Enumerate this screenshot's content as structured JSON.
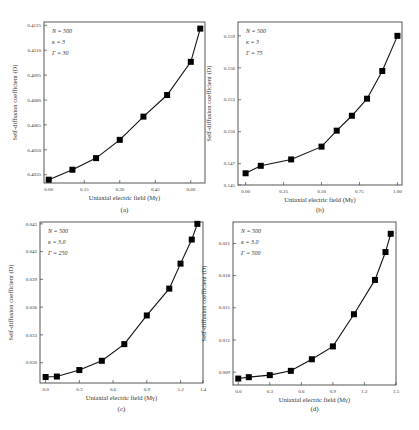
{
  "chart_data": [
    {
      "type": "line",
      "panel": "a",
      "caption": "(a)",
      "xlabel": "Uniaxial electric field (Mγ)",
      "ylabel": "Self-diffusion coefficient (D)",
      "annotations": [
        "N = 500",
        "κ = 3",
        "Γ = 30"
      ],
      "xlim": [
        -0.02,
        0.66
      ],
      "ylim": [
        0.403,
        0.4127
      ],
      "xticks": [
        0.0,
        0.15,
        0.3,
        0.45,
        0.6
      ],
      "xtick_labels": [
        "0.00",
        "0.15",
        "0.30",
        "0.45",
        "0.60"
      ],
      "yticks": [
        0.4035,
        0.405,
        0.4065,
        0.408,
        0.4095,
        0.411,
        0.4125
      ],
      "ytick_labels": [
        "0.4035",
        "0.4050",
        "0.4065",
        "0.4080",
        "0.4095",
        "0.4110",
        "0.4125"
      ],
      "grid": false,
      "marker": "square",
      "series": [
        {
          "name": "D",
          "x": [
            0.0,
            0.1,
            0.2,
            0.3,
            0.4,
            0.5,
            0.6,
            0.64
          ],
          "y": [
            0.4032,
            0.4038,
            0.4045,
            0.4056,
            0.407,
            0.4083,
            0.4103,
            0.4123
          ]
        }
      ]
    },
    {
      "type": "line",
      "panel": "b",
      "caption": "(b)",
      "xlabel": "Uniaxial electric field (Mγ)",
      "ylabel": "Self-diffusion coefficient (D)",
      "annotations": [
        "N = 500",
        "κ = 3",
        "Γ = 75"
      ],
      "xlim": [
        -0.05,
        1.03
      ],
      "ylim": [
        0.145,
        0.1603
      ],
      "xticks": [
        0.0,
        0.25,
        0.5,
        0.75,
        1.0
      ],
      "xtick_labels": [
        "0.00",
        "0.25",
        "0.50",
        "0.75",
        "1.00"
      ],
      "yticks": [
        0.145,
        0.147,
        0.15,
        0.153,
        0.156,
        0.159
      ],
      "ytick_labels": [
        "0.145",
        "0.147",
        "0.150",
        "0.153",
        "0.156",
        "0.159"
      ],
      "grid": false,
      "marker": "square",
      "series": [
        {
          "name": "D",
          "x": [
            0.0,
            0.1,
            0.3,
            0.5,
            0.6,
            0.7,
            0.8,
            0.9,
            1.0
          ],
          "y": [
            0.1461,
            0.1468,
            0.1474,
            0.1486,
            0.1501,
            0.1515,
            0.1531,
            0.1557,
            0.159
          ]
        }
      ]
    },
    {
      "type": "line",
      "panel": "c",
      "caption": "(c)",
      "xlabel": "Uniaxial electric field (Mγ)",
      "ylabel": "Self-diffusion coefficient (D)",
      "annotations": [
        "N = 500",
        "κ = 3.0",
        "Γ = 250"
      ],
      "xlim": [
        -0.05,
        1.4
      ],
      "ylim": [
        0.0278,
        0.0452
      ],
      "xticks": [
        0.0,
        0.3,
        0.6,
        0.9,
        1.2,
        1.4
      ],
      "xtick_labels": [
        "0.0",
        "0.3",
        "0.6",
        "0.9",
        "1.2",
        "1.4"
      ],
      "yticks": [
        0.03,
        0.033,
        0.036,
        0.039,
        0.042,
        0.045
      ],
      "ytick_labels": [
        "0.030",
        "0.033",
        "0.036",
        "0.039",
        "0.042",
        "0.045"
      ],
      "grid": false,
      "marker": "square",
      "series": [
        {
          "name": "D",
          "x": [
            0.0,
            0.1,
            0.3,
            0.5,
            0.7,
            0.9,
            1.1,
            1.2,
            1.3,
            1.35
          ],
          "y": [
            0.02845,
            0.0285,
            0.0292,
            0.0302,
            0.032,
            0.0351,
            0.038,
            0.0407,
            0.0433,
            0.045
          ]
        }
      ]
    },
    {
      "type": "line",
      "panel": "d",
      "caption": "(d)",
      "xlabel": "Uniaxial electric field (Mγ)",
      "ylabel": "Self-diffusion coefficient (D)",
      "annotations": [
        "N = 500",
        "κ = 3.0",
        "Γ = 500"
      ],
      "xlim": [
        -0.05,
        1.5
      ],
      "ylim": [
        0.0078,
        0.023
      ],
      "xticks": [
        0.0,
        0.3,
        0.6,
        0.9,
        1.2,
        1.5
      ],
      "xtick_labels": [
        "0.0",
        "0.3",
        "0.6",
        "0.9",
        "1.2",
        "1.5"
      ],
      "yticks": [
        0.009,
        0.012,
        0.015,
        0.018,
        0.021
      ],
      "ytick_labels": [
        "0.009",
        "0.012",
        "0.015",
        "0.018",
        "0.021"
      ],
      "grid": false,
      "marker": "square",
      "series": [
        {
          "name": "D",
          "x": [
            0.0,
            0.1,
            0.3,
            0.5,
            0.7,
            0.9,
            1.1,
            1.3,
            1.4,
            1.45
          ],
          "y": [
            0.0084,
            0.00853,
            0.00872,
            0.00912,
            0.0102,
            0.0114,
            0.0144,
            0.0176,
            0.0202,
            0.0219
          ]
        }
      ]
    }
  ]
}
